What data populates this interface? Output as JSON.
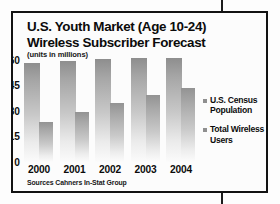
{
  "chart_data": {
    "type": "bar",
    "title": "U.S. Youth Market (Age 10-24) Wireless Subscriber Forecast",
    "title_lines": [
      "U.S. Youth Market (Age 10-24)",
      "Wireless Subscriber Forecast"
    ],
    "subtitle": "(units in millions)",
    "xlabel": "",
    "ylabel": "",
    "ylim": [
      0,
      60
    ],
    "yticks": [
      60,
      45,
      30,
      15,
      0
    ],
    "grid": false,
    "legend_position": "right",
    "categories": [
      "2000",
      "2001",
      "2002",
      "2003",
      "2004"
    ],
    "series": [
      {
        "name": "U.S. Census Population",
        "values": [
          59,
          60,
          61,
          61.5,
          62
        ]
      },
      {
        "name": "Total Wireless Users",
        "values": [
          24,
          29.5,
          35,
          40,
          44
        ]
      }
    ],
    "source": "Sources Cahners In-Stat Group",
    "colors": {
      "bar_top": "#8e8e8e",
      "bar_bottom": "#fbfbfb",
      "legend_swatch": "#8f8f8f",
      "frame": "#121212",
      "text": "#0b0b0b",
      "background": "#fdfdfd"
    }
  }
}
